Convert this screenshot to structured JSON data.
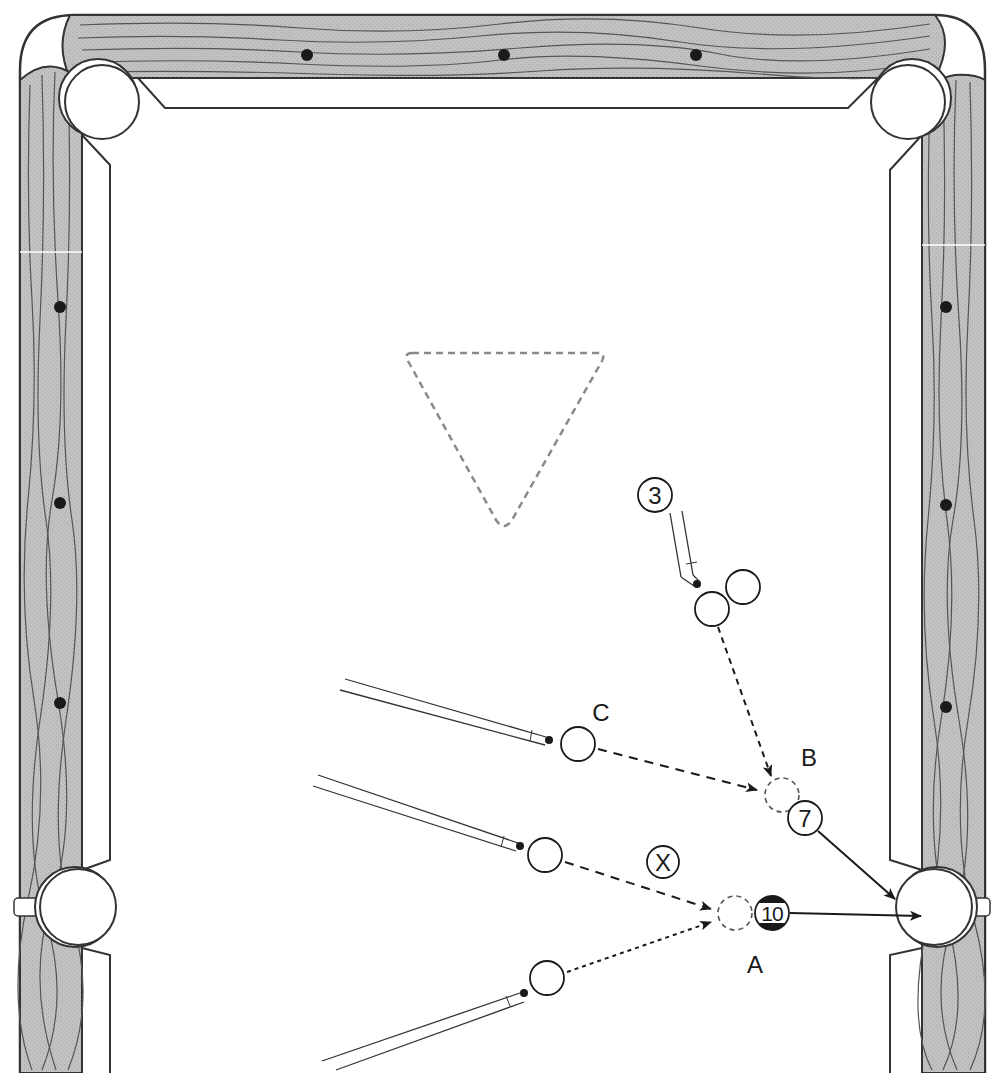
{
  "diagram": {
    "type": "pool-table-shot-diagram",
    "colors": {
      "background": "#ffffff",
      "wood": "#bdbdbd",
      "line": "#333333",
      "rack_dash": "#8a8a8a",
      "ink": "#1a1a1a"
    },
    "labels": {
      "ball_3": "3",
      "ball_7": "7",
      "ball_10": "10",
      "ball_x": "X",
      "position_a": "A",
      "position_b": "B",
      "position_c": "C"
    },
    "pockets": [
      {
        "id": "top-left-corner-pocket",
        "cx": 100,
        "cy": 100,
        "r": 37
      },
      {
        "id": "top-right-corner-pocket",
        "cx": 910,
        "cy": 100,
        "r": 37
      },
      {
        "id": "left-side-pocket",
        "cx": 77,
        "cy": 907,
        "r": 38
      },
      {
        "id": "right-side-pocket",
        "cx": 935,
        "cy": 907,
        "r": 38
      }
    ],
    "diamonds": {
      "top": [
        307,
        504,
        696
      ],
      "left": [
        307,
        503,
        703
      ],
      "right": [
        307,
        505,
        707
      ]
    },
    "rack": {
      "points": [
        [
          405,
          353
        ],
        [
          605,
          353
        ],
        [
          504,
          527
        ]
      ]
    },
    "balls": [
      {
        "id": "ball-3-label",
        "cx": 655,
        "cy": 495,
        "r": 17,
        "label": "3",
        "style": "numbered"
      },
      {
        "id": "cue-ball-top",
        "cx": 712,
        "cy": 609,
        "r": 17,
        "style": "plain"
      },
      {
        "id": "object-ball-top",
        "cx": 743,
        "cy": 587,
        "r": 17,
        "style": "plain"
      },
      {
        "id": "cue-ball-c",
        "cx": 578,
        "cy": 744,
        "r": 17,
        "style": "plain"
      },
      {
        "id": "cue-ball-middle",
        "cx": 545,
        "cy": 855,
        "r": 17,
        "style": "plain"
      },
      {
        "id": "cue-ball-bottom",
        "cx": 547,
        "cy": 978,
        "r": 17,
        "style": "plain"
      },
      {
        "id": "ball-x",
        "cx": 663,
        "cy": 862,
        "r": 14,
        "label": "X",
        "style": "numbered"
      },
      {
        "id": "ghost-ball-a",
        "cx": 735,
        "cy": 913,
        "r": 17,
        "style": "ghost"
      },
      {
        "id": "ball-10",
        "cx": 772,
        "cy": 913,
        "r": 17,
        "label": "10",
        "style": "striped"
      },
      {
        "id": "ghost-ball-b",
        "cx": 782,
        "cy": 795,
        "r": 17,
        "style": "ghost"
      },
      {
        "id": "ball-7",
        "cx": 805,
        "cy": 818,
        "r": 17,
        "label": "7",
        "style": "numbered"
      }
    ],
    "paths": [
      {
        "id": "path-cue-top-to-ghost-b",
        "from": [
          718,
          627
        ],
        "to": [
          772,
          776
        ],
        "style": "dashed"
      },
      {
        "id": "path-cue-c-to-ghost-b",
        "from": [
          597,
          749
        ],
        "to": [
          757,
          790
        ],
        "style": "dashed"
      },
      {
        "id": "path-cue-middle-to-ghost-a",
        "from": [
          563,
          861
        ],
        "to": [
          710,
          909
        ],
        "style": "dashed"
      },
      {
        "id": "path-cue-bottom-to-ghost-a",
        "from": [
          566,
          972
        ],
        "to": [
          710,
          921
        ],
        "style": "dotted"
      },
      {
        "id": "path-7-to-pocket",
        "from": [
          817,
          831
        ],
        "to": [
          893,
          898
        ],
        "style": "solid"
      },
      {
        "id": "path-10-to-pocket",
        "from": [
          790,
          913
        ],
        "to": [
          920,
          917
        ],
        "style": "solid"
      }
    ]
  }
}
